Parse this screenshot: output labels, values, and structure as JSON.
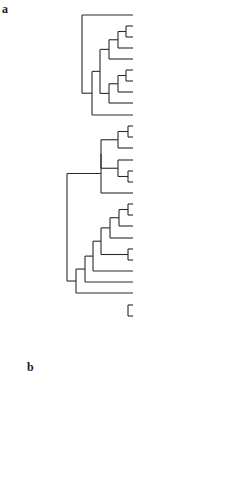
{
  "figure": {
    "panels": [
      {
        "id": "a",
        "label": "a",
        "label_pos": [
          2,
          8
        ],
        "leaf_x": 133,
        "text_x": 135,
        "leaves": [
          {
            "genus": "Homo",
            "suffix": " retina",
            "y": 15
          },
          {
            "genus": "Oryctolagus",
            "suffix": " sk2 1",
            "y": 26
          },
          {
            "genus": "Oryctolagus",
            "suffix": " sk2 2",
            "y": 37
          },
          {
            "genus": "Rattus",
            "suffix": " sk2",
            "y": 48
          },
          {
            "genus": "Gallus",
            "suffix": " sk2",
            "y": 59
          },
          {
            "genus": "Rattus",
            "suffix": " cd2",
            "y": 70
          },
          {
            "genus": "Homo",
            "suffix": " vt",
            "y": 81
          },
          {
            "genus": "Gallus",
            "suffix": " cd2A",
            "y": 92
          },
          {
            "genus": "Gallus",
            "suffix": " cd2B",
            "y": 103
          },
          {
            "genus": "Halocynthia",
            "suffix": "",
            "y": 115
          },
          {
            "genus": "Sus",
            "suffix": " sm",
            "y": 126
          },
          {
            "genus": "Gallus",
            "suffix": " sm",
            "y": 137
          },
          {
            "genus": "Homo",
            "suffix": " artery",
            "y": 148
          },
          {
            "genus": "Homo",
            "suffix": " placenta",
            "y": 160
          },
          {
            "genus": "Rattus",
            "suffix": " RLCB",
            "y": 171
          },
          {
            "genus": "Rattus",
            "suffix": " RLCA",
            "y": 182
          },
          {
            "genus": "Drosophila",
            "suffix": " nonmuscle",
            "y": 193
          },
          {
            "genus": "Pecten",
            "suffix": "",
            "y": 204
          },
          {
            "genus": "Aquipecten",
            "suffix": "",
            "y": 215
          },
          {
            "genus": "Chlamys",
            "suffix": "",
            "y": 226
          },
          {
            "genus": "Patinopecten",
            "suffix": " sk",
            "y": 238
          },
          {
            "genus": "Patinopecten",
            "suffix": " sm-A",
            "y": 249
          },
          {
            "genus": "Patinopecten",
            "suffix": " sm-B",
            "y": 260
          },
          {
            "genus": "Spisula",
            "suffix": " sk",
            "y": 271
          },
          {
            "genus": "Lumbricus",
            "suffix": "",
            "y": 282
          },
          {
            "genus": "Todarodes",
            "suffix": " sk",
            "y": 293
          },
          {
            "genus": "Caenorhabditis",
            "suffix": " RLC1",
            "y": 305
          },
          {
            "genus": "Caenorhabditis",
            "suffix": " RLC2",
            "y": 316
          },
          {
            "genus": "Drosophila",
            "suffix": "",
            "y": 327
          },
          {
            "genus": "Dictyostelium",
            "suffix": "",
            "y": 338
          }
        ],
        "nodes": [
          {
            "x": 126,
            "children": [
              1,
              2
            ]
          },
          {
            "x": 118,
            "children": [
              "n0",
              3
            ]
          },
          {
            "x": 109,
            "children": [
              "n1",
              4
            ]
          },
          {
            "x": 126,
            "children": [
              5,
              6
            ]
          },
          {
            "x": 118,
            "children": [
              "n3",
              7
            ]
          },
          {
            "x": 109,
            "children": [
              "n4",
              8
            ]
          },
          {
            "x": 100,
            "children": [
              "n2",
              "n5"
            ]
          },
          {
            "x": 92,
            "children": [
              "n6",
              9
            ]
          },
          {
            "x": 82,
            "children": [
              0,
              "n7"
            ]
          },
          {
            "x": 128,
            "children": [
              10,
              11
            ]
          },
          {
            "x": 118,
            "children": [
              "n9",
              12
            ]
          },
          {
            "x": 128,
            "children": [
              14,
              15
            ]
          },
          {
            "x": 118,
            "children": [
              13,
              "n11"
            ]
          },
          {
            "x": 101,
            "children": [
              "n10",
              "n12"
            ]
          },
          {
            "x": 101,
            "children": [
              "n13",
              16
            ]
          },
          {
            "x": 128,
            "children": [
              17,
              18
            ]
          },
          {
            "x": 119,
            "children": [
              "n15",
              19
            ]
          },
          {
            "x": 110,
            "children": [
              "n16",
              20
            ]
          },
          {
            "x": 128,
            "children": [
              21,
              22
            ]
          },
          {
            "x": 101,
            "children": [
              "n17",
              "n18"
            ]
          },
          {
            "x": 93,
            "children": [
              "n19",
              23
            ]
          },
          {
            "x": 85,
            "children": [
              "n20",
              24
            ]
          },
          {
            "x": 76,
            "children": [
              "n21",
              25
            ]
          },
          {
            "x": 67,
            "children": [
              "n14",
              "n22"
            ]
          },
          {
            "x": 128,
            "children": [
              26,
              27
            ]
          },
          {
            "x": 58,
            "children": [
              "n23",
              "n26"
            ]
          },
          {
            "x": 49,
            "children": [
              "n8",
              "n25"
            ]
          },
          {
            "x": 40,
            "children": [
              "n27",
              28
            ]
          },
          {
            "x": 32,
            "children": [
              "n28",
              29
            ]
          }
        ],
        "root_stub": 24
      },
      {
        "id": "b",
        "label": "b",
        "label_pos": [
          27,
          367
        ],
        "leaf_x": 126,
        "text_x": 128,
        "leaves": [
          {
            "genus": "Oryctolagus",
            "suffix": " sk2 1",
            "y": 370
          },
          {
            "genus": "Oryctolagus",
            "suffix": " sk2 2",
            "y": 380
          },
          {
            "genus": "Rattus",
            "suffix": " sk2",
            "y": 390
          },
          {
            "genus": "Rattus",
            "suffix": " cd2",
            "y": 400
          },
          {
            "genus": "Homo",
            "suffix": " vt",
            "y": 410
          },
          {
            "genus": "Homo",
            "suffix": " artery",
            "y": 420
          },
          {
            "genus": "Drosophila",
            "suffix": " nonmuscle",
            "y": 431
          },
          {
            "genus": "Homo",
            "suffix": " placenta",
            "y": 441
          },
          {
            "genus": "Rattus",
            "suffix": " RLCA",
            "y": 451
          },
          {
            "genus": "Rattus",
            "suffix": " RLCB",
            "y": 462
          },
          {
            "genus": "Aquipecten",
            "suffix": "",
            "y": 472
          },
          {
            "genus": "Drosophila",
            "suffix": "",
            "y": 482
          }
        ],
        "nodes": [
          {
            "x": 114,
            "children": [
              0,
              1
            ]
          },
          {
            "x": 101,
            "children": [
              "n0",
              2
            ]
          },
          {
            "x": 114,
            "children": [
              3,
              4
            ]
          },
          {
            "x": 88,
            "children": [
              "n1",
              "n2"
            ]
          },
          {
            "x": 114,
            "children": [
              5,
              6
            ]
          },
          {
            "x": 114,
            "children": [
              7,
              8
            ]
          },
          {
            "x": 102,
            "children": [
              "n5",
              9
            ]
          },
          {
            "x": 89,
            "children": [
              "n4",
              "n6"
            ]
          },
          {
            "x": 76,
            "children": [
              "n3",
              "n7"
            ]
          },
          {
            "x": 63,
            "children": [
              "n8",
              10
            ]
          },
          {
            "x": 51,
            "children": [
              "n9",
              11
            ]
          }
        ],
        "root_stub": 38
      }
    ],
    "caption_fragment": "...d ... Trees of myosin regulatory light chains ..."
  },
  "style": {
    "line_color": "#2a2a2a",
    "text_color": "#1a1a1a"
  }
}
